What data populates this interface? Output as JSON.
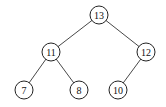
{
  "tree": {
    "nodes": [
      {
        "id": "n13",
        "label": "13",
        "x": 99,
        "y": 15
      },
      {
        "id": "n11",
        "label": "11",
        "x": 51,
        "y": 52
      },
      {
        "id": "n12",
        "label": "12",
        "x": 146,
        "y": 52
      },
      {
        "id": "n7",
        "label": "7",
        "x": 24,
        "y": 90
      },
      {
        "id": "n8",
        "label": "8",
        "x": 79,
        "y": 90
      },
      {
        "id": "n10",
        "label": "10",
        "x": 118,
        "y": 90
      }
    ],
    "edges": [
      [
        "n13",
        "n11"
      ],
      [
        "n13",
        "n12"
      ],
      [
        "n11",
        "n7"
      ],
      [
        "n11",
        "n8"
      ],
      [
        "n12",
        "n10"
      ]
    ]
  }
}
